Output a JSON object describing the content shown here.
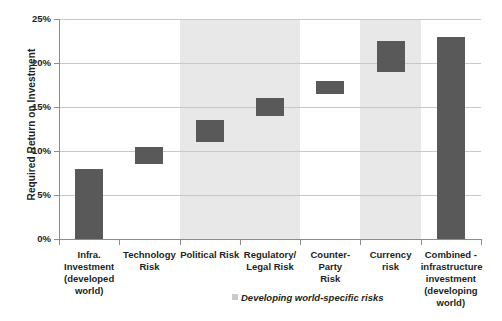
{
  "chart_data": {
    "type": "bar",
    "title": "",
    "subtitle": "",
    "xlabel": "",
    "ylabel": "Required Return on Investment",
    "ylim": [
      0,
      25
    ],
    "yunit": "%",
    "grid": true,
    "legend_position": "below-axis-right",
    "categories": [
      "Infra. Investment (developed world)",
      "Technology Risk",
      "Political Risk",
      "Regulatory/ Legal Risk",
      "Counter-Party Risk",
      "Currency risk",
      "Combined - infrastructure investment (developing world)"
    ],
    "category_lines": [
      [
        "Infra.",
        "Investment",
        "(developed",
        "world)"
      ],
      [
        "Technology",
        "Risk"
      ],
      [
        "Political Risk"
      ],
      [
        "Regulatory/",
        "Legal Risk"
      ],
      [
        "Counter-Party",
        "Risk"
      ],
      [
        "Currency risk"
      ],
      [
        "Combined -",
        "infrastructure",
        "investment",
        "(developing",
        "world)"
      ]
    ],
    "series": [
      {
        "name": "Required Return on Investment",
        "kind": "floating-bar",
        "bars": [
          {
            "category": "Infra. Investment (developed world)",
            "base": 0.0,
            "top": 8.0,
            "value": 8.0
          },
          {
            "category": "Technology Risk",
            "base": 8.5,
            "top": 10.5,
            "value": 2.0
          },
          {
            "category": "Political Risk",
            "base": 11.0,
            "top": 13.5,
            "value": 2.5
          },
          {
            "category": "Regulatory/ Legal Risk",
            "base": 14.0,
            "top": 16.0,
            "value": 2.0
          },
          {
            "category": "Counter-Party Risk",
            "base": 16.5,
            "top": 18.0,
            "value": 1.5
          },
          {
            "category": "Currency risk",
            "base": 19.0,
            "top": 22.5,
            "value": 3.5
          },
          {
            "category": "Combined - infrastructure investment (developing world)",
            "base": 0.0,
            "top": 23.0,
            "value": 23.0
          }
        ]
      }
    ],
    "yticks": [
      "0%",
      "5%",
      "10%",
      "15%",
      "20%",
      "25%"
    ],
    "ytick_values": [
      0,
      5,
      10,
      15,
      20,
      25
    ],
    "shaded_regions": [
      {
        "label": "Developing world-specific risks",
        "categories": [
          "Political Risk",
          "Regulatory/ Legal Risk"
        ]
      },
      {
        "label": "Developing world-specific risks",
        "categories": [
          "Currency risk"
        ]
      }
    ],
    "annotations": [
      {
        "text": "= Developing world-specific risks",
        "style": "italic"
      }
    ],
    "colors": {
      "bar": "#595959",
      "shade": "#e8e8e8",
      "grid": "#c9c9c9",
      "axis": "#8c8c8c",
      "text": "#231f20",
      "background": "#ffffff"
    }
  },
  "legend": {
    "note": "= Developing world-specific risks"
  }
}
